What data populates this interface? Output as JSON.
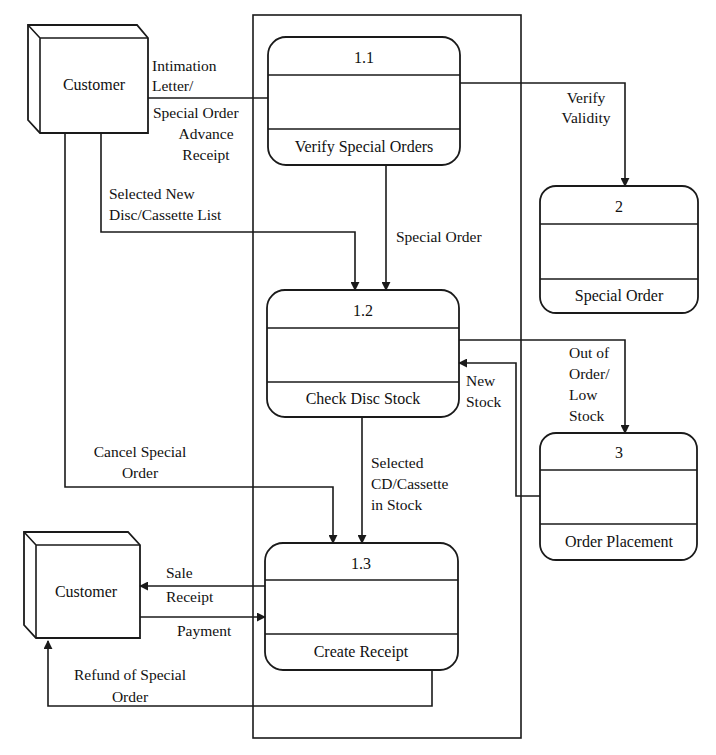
{
  "diagram": {
    "type": "data-flow-diagram",
    "boundary": {
      "label": ""
    },
    "entities": [
      {
        "id": "customer_top",
        "label": "Customer"
      },
      {
        "id": "customer_bottom",
        "label": "Customer"
      }
    ],
    "processes": [
      {
        "id": "1.1",
        "number": "1.1",
        "name": "Verify Special Orders"
      },
      {
        "id": "1.2",
        "number": "1.2",
        "name": "Check Disc Stock"
      },
      {
        "id": "1.3",
        "number": "1.3",
        "name": "Create Receipt"
      },
      {
        "id": "2",
        "number": "2",
        "name": "Special Order"
      },
      {
        "id": "3",
        "number": "3",
        "name": "Order Placement"
      }
    ],
    "flows": [
      {
        "from": "customer_top",
        "to": "1.1",
        "label_lines": [
          "Intimation",
          "Letter/"
        ],
        "label_lines_below": [
          "Special Order",
          "Advance",
          "Receipt"
        ]
      },
      {
        "from": "1.1",
        "to": "2",
        "label_lines": [
          "Verify",
          "Validity"
        ]
      },
      {
        "from": "customer_top",
        "to": "1.2",
        "label_lines": [
          "Selected New",
          "Disc/Cassette List"
        ]
      },
      {
        "from": "1.1",
        "to": "1.2",
        "label_lines": [
          "Special Order"
        ]
      },
      {
        "from": "1.2",
        "to": "3",
        "label_lines": [
          "Out of",
          "Order/",
          "Low",
          "Stock"
        ]
      },
      {
        "from": "3",
        "to": "1.2",
        "label_lines": [
          "New",
          "Stock"
        ]
      },
      {
        "from": "customer_top",
        "to": "1.3",
        "label_lines": [
          "Cancel Special",
          "Order"
        ]
      },
      {
        "from": "1.2",
        "to": "1.3",
        "label_lines": [
          "Selected",
          "CD/Cassette",
          "in Stock"
        ]
      },
      {
        "from": "1.3",
        "to": "customer_bottom",
        "label_lines": [
          "Sale",
          "Receipt"
        ]
      },
      {
        "from": "customer_bottom",
        "to": "1.3",
        "label_lines": [
          "Payment"
        ]
      },
      {
        "from": "1.3",
        "to": "customer_bottom",
        "label_lines": [
          "Refund of Special",
          "Order"
        ]
      }
    ]
  },
  "colors": {
    "stroke": "#1a1a1a",
    "background": "#ffffff",
    "text": "#111111"
  }
}
